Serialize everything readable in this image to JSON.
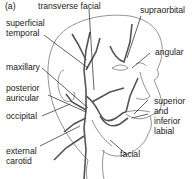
{
  "figure": {
    "panel_label": "(a)"
  },
  "labels": {
    "transverse_facial": "transverse facial",
    "supraorbital": "supraorbital",
    "superficial_temporal_1": "superficial",
    "superficial_temporal_2": "temporal",
    "angular": "angular",
    "maxillary": "maxillary",
    "posterior_auricular_1": "posterior",
    "posterior_auricular_2": "auricular",
    "occipital": "occipital",
    "superior_inferior_labial_1": "superior",
    "superior_inferior_labial_2": "and",
    "superior_inferior_labial_3": "inferior",
    "superior_inferior_labial_4": "labial",
    "external_carotid_1": "external",
    "external_carotid_2": "carotid",
    "facial": "facial"
  },
  "colors": {
    "line": "#333333",
    "artery": "#555555",
    "text": "#1a1a1a"
  }
}
